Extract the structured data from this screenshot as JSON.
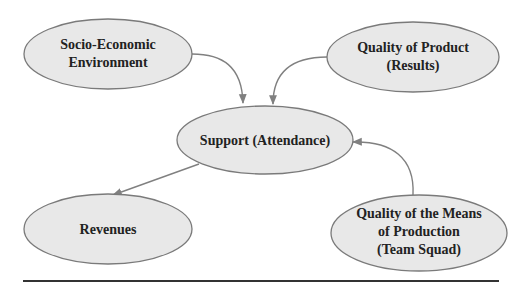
{
  "diagram": {
    "type": "influence-flow",
    "colors": {
      "node_fill": "#e8e8e8",
      "node_stroke": "#7a7a7a",
      "edge": "#808080",
      "text": "#222222",
      "rule": "#333333"
    },
    "nodes": {
      "socio": {
        "lines": [
          "Socio-Economic",
          "Environment"
        ]
      },
      "product": {
        "lines": [
          "Quality of Product",
          "(Results)"
        ]
      },
      "support": {
        "lines": [
          "Support (Attendance)"
        ]
      },
      "revenues": {
        "lines": [
          "Revenues"
        ]
      },
      "means": {
        "lines": [
          "Quality of the Means",
          "of Production",
          "(Team Squad)"
        ]
      }
    },
    "edges": [
      {
        "from": "Socio-Economic Environment",
        "to": "Support (Attendance)"
      },
      {
        "from": "Quality of Product (Results)",
        "to": "Support (Attendance)"
      },
      {
        "from": "Quality of the Means of Production (Team Squad)",
        "to": "Support (Attendance)"
      },
      {
        "from": "Support (Attendance)",
        "to": "Revenues"
      }
    ]
  }
}
